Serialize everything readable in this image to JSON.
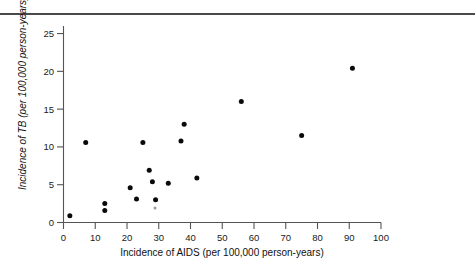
{
  "figure": {
    "background_color": "#ffffff",
    "top_rule_color": "#4a4a4a",
    "point_color": "#0a0a0a",
    "axis_color": "#545454"
  },
  "chart_data": {
    "type": "scatter",
    "title": "",
    "xlabel": "Incidence of AIDS (per 100,000 person-years)",
    "ylabel": "Incidence of TB (per 100,000 person-years)",
    "xlim": [
      0,
      100
    ],
    "ylim": [
      0,
      26
    ],
    "xticks": [
      0,
      10,
      20,
      30,
      40,
      50,
      60,
      70,
      80,
      90,
      100
    ],
    "xticklabels": [
      "0",
      "10",
      "20",
      "30",
      "40",
      "50",
      "60",
      "70",
      "80",
      "90",
      "100"
    ],
    "yticks": [
      0,
      5,
      10,
      15,
      20,
      25
    ],
    "yticklabels": [
      "0",
      "5",
      "10",
      "15",
      "20",
      "25"
    ],
    "grid": false,
    "legend": null,
    "marker": "filled-circle",
    "points": [
      {
        "x": 2,
        "y": 0.9
      },
      {
        "x": 7,
        "y": 10.6
      },
      {
        "x": 13,
        "y": 2.5
      },
      {
        "x": 13,
        "y": 1.6
      },
      {
        "x": 21,
        "y": 4.6
      },
      {
        "x": 23,
        "y": 3.1
      },
      {
        "x": 25,
        "y": 10.6
      },
      {
        "x": 27,
        "y": 6.9
      },
      {
        "x": 28,
        "y": 5.4
      },
      {
        "x": 29,
        "y": 3.0
      },
      {
        "x": 33,
        "y": 5.2
      },
      {
        "x": 37,
        "y": 10.8
      },
      {
        "x": 38,
        "y": 13.0
      },
      {
        "x": 42,
        "y": 5.9
      },
      {
        "x": 56,
        "y": 16.0
      },
      {
        "x": 75,
        "y": 11.5
      },
      {
        "x": 91,
        "y": 20.4
      }
    ]
  }
}
